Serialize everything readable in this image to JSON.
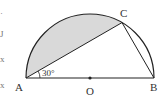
{
  "diagram": {
    "type": "geometry",
    "points": {
      "A": {
        "label": "A",
        "x": 26,
        "y": 78
      },
      "B": {
        "label": "B",
        "x": 154,
        "y": 78
      },
      "O": {
        "label": "O",
        "x": 90,
        "y": 78
      },
      "C": {
        "label": "C",
        "x": 122,
        "y": 22.6
      }
    },
    "angle_label": "30°",
    "colors": {
      "stroke": "#222222",
      "shade": "#d9d9d9",
      "background": "#ffffff"
    },
    "cropped_left_text": [
      "·",
      "J",
      "x",
      "x"
    ]
  }
}
